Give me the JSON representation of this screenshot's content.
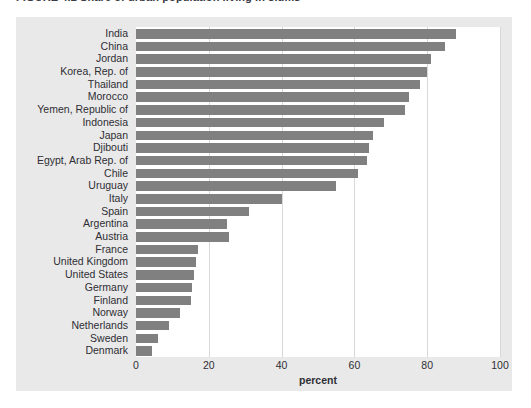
{
  "figure": {
    "title_partial": "FIGURE 4.2   Share of urban population living in slums",
    "caption_partial": "",
    "panel_bg": "#e9e9e9",
    "plot_bg": "#ffffff",
    "bar_color": "#808080",
    "grid_color": "#d8d8d8"
  },
  "chart_data": {
    "type": "bar",
    "orientation": "horizontal",
    "title": "FIGURE 4.2   Share of urban population living in slums",
    "xlabel": "percent",
    "ylabel": "",
    "xlim": [
      0,
      100
    ],
    "xticks": [
      0,
      20,
      40,
      60,
      80,
      100
    ],
    "xtick_labels": [
      "0",
      "20",
      "40",
      "60",
      "80",
      "100"
    ],
    "grid": true,
    "grid_axis": "x",
    "legend": null,
    "categories": [
      "India",
      "China",
      "Jordan",
      "Korea, Rep. of",
      "Thailand",
      "Morocco",
      "Yemen, Republic of",
      "Indonesia",
      "Japan",
      "Djibouti",
      "Egypt, Arab Rep. of",
      "Chile",
      "Uruguay",
      "Italy",
      "Spain",
      "Argentina",
      "Austria",
      "France",
      "United Kingdom",
      "United States",
      "Germany",
      "Finland",
      "Norway",
      "Netherlands",
      "Sweden",
      "Denmark"
    ],
    "values": [
      88.0,
      85.0,
      81.0,
      80.0,
      78.0,
      75.0,
      74.0,
      68.0,
      65.0,
      64.0,
      63.5,
      61.0,
      55.0,
      40.0,
      31.0,
      25.0,
      25.5,
      17.0,
      16.5,
      16.0,
      15.5,
      15.0,
      12.0,
      9.0,
      6.0,
      4.5
    ]
  }
}
